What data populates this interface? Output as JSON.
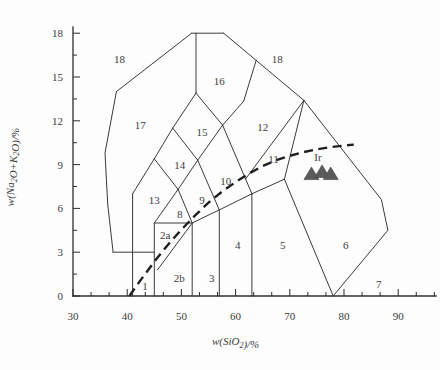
{
  "figure": {
    "type_note": "TAS classification diagram",
    "x_axis_title_parts": [
      [
        "t",
        "w(SiO"
      ],
      [
        "s",
        "2"
      ],
      [
        "t",
        ")/%"
      ]
    ],
    "y_axis_title_parts": [
      [
        "t",
        "w(Na"
      ],
      [
        "s",
        "2"
      ],
      [
        "t",
        "O+K"
      ],
      [
        "s",
        "2"
      ],
      [
        "t",
        "O)/%"
      ]
    ]
  },
  "chart_data": {
    "type": "scatter",
    "title": "",
    "xlabel": "w(SiO2)/%",
    "ylabel": "w(Na2O+K2O)/%",
    "xlim": [
      30,
      97
    ],
    "ylim": [
      0,
      18.5
    ],
    "grid": "off",
    "x_major_ticks": [
      30,
      40,
      50,
      60,
      70,
      80,
      90
    ],
    "y_major_ticks": [
      0,
      3,
      6,
      9,
      12,
      15,
      18
    ],
    "x_minor_step": 3.3333,
    "y_minor_step": 1.5,
    "field_boundaries": [
      {
        "name": "v41",
        "points": [
          [
            41,
            0
          ],
          [
            41,
            7
          ]
        ]
      },
      {
        "name": "v45",
        "points": [
          [
            45,
            0
          ],
          [
            45,
            5
          ]
        ]
      },
      {
        "name": "v52",
        "points": [
          [
            52,
            0
          ],
          [
            52,
            5
          ]
        ]
      },
      {
        "name": "v57",
        "points": [
          [
            57,
            0
          ],
          [
            57,
            5.9
          ]
        ]
      },
      {
        "name": "v63",
        "points": [
          [
            63,
            0
          ],
          [
            63,
            7
          ]
        ]
      },
      {
        "name": "h3",
        "points": [
          [
            37.4,
            3
          ],
          [
            45,
            3
          ]
        ]
      },
      {
        "name": "h5",
        "points": [
          [
            45,
            5
          ],
          [
            52,
            5
          ]
        ]
      },
      {
        "name": "divider-2a-2b",
        "points": [
          [
            45.6,
            1.8
          ],
          [
            52,
            5
          ]
        ]
      },
      {
        "name": "b-52-57",
        "points": [
          [
            52,
            5
          ],
          [
            57,
            5.9
          ]
        ]
      },
      {
        "name": "b-57-63",
        "points": [
          [
            57,
            5.9
          ],
          [
            63,
            7
          ]
        ]
      },
      {
        "name": "top-of-5",
        "points": [
          [
            63,
            7
          ],
          [
            69,
            8
          ]
        ]
      },
      {
        "name": "b-5-6",
        "points": [
          [
            69,
            8
          ],
          [
            78,
            0
          ]
        ]
      },
      {
        "name": "tri8-left",
        "points": [
          [
            45,
            5
          ],
          [
            49.4,
            7.3
          ]
        ]
      },
      {
        "name": "tri8-right",
        "points": [
          [
            49.4,
            7.3
          ],
          [
            52,
            5
          ]
        ]
      },
      {
        "name": "b-13-top",
        "points": [
          [
            41,
            7
          ],
          [
            45,
            9.4
          ]
        ]
      },
      {
        "name": "b-13-14",
        "points": [
          [
            45,
            9.4
          ],
          [
            49.4,
            7.3
          ]
        ]
      },
      {
        "name": "d14-ul",
        "points": [
          [
            45,
            9.4
          ],
          [
            48.4,
            11.5
          ]
        ]
      },
      {
        "name": "d14-ur",
        "points": [
          [
            48.4,
            11.5
          ],
          [
            53,
            9.3
          ]
        ]
      },
      {
        "name": "d14-lr",
        "points": [
          [
            53,
            9.3
          ],
          [
            49.4,
            7.3
          ]
        ]
      },
      {
        "name": "d15-ul",
        "points": [
          [
            48.4,
            11.5
          ],
          [
            52.7,
            13.9
          ]
        ]
      },
      {
        "name": "d15-ur",
        "points": [
          [
            52.7,
            13.9
          ],
          [
            57.6,
            11.7
          ]
        ]
      },
      {
        "name": "d15-lr",
        "points": [
          [
            57.6,
            11.7
          ],
          [
            53,
            9.3
          ]
        ]
      },
      {
        "name": "b-9-10",
        "points": [
          [
            53,
            9.3
          ],
          [
            57,
            5.9
          ]
        ]
      },
      {
        "name": "b-10-11",
        "points": [
          [
            57.6,
            11.7
          ],
          [
            63,
            7
          ]
        ]
      },
      {
        "name": "divider-11-12",
        "points": [
          [
            61.8,
            8.0
          ],
          [
            72.6,
            13.4
          ]
        ]
      },
      {
        "name": "b-11-6",
        "points": [
          [
            69,
            8
          ],
          [
            72.6,
            13.4
          ]
        ]
      },
      {
        "name": "roof-right",
        "points": [
          [
            57.8,
            18
          ],
          [
            72.6,
            13.4
          ]
        ]
      },
      {
        "name": "b-16-12",
        "points": [
          [
            57.6,
            11.7
          ],
          [
            61.5,
            13.35
          ],
          [
            63.8,
            16.15
          ]
        ]
      },
      {
        "name": "b-16-left",
        "points": [
          [
            52.7,
            13.9
          ],
          [
            52.7,
            18
          ]
        ]
      },
      {
        "name": "top-plateau",
        "points": [
          [
            51.9,
            18
          ],
          [
            57.8,
            18
          ]
        ]
      },
      {
        "name": "roof-left",
        "points": [
          [
            51.9,
            18
          ],
          [
            38,
            14
          ]
        ]
      },
      {
        "name": "left-edge-17",
        "points": [
          [
            38,
            14
          ],
          [
            35.9,
            9.8
          ],
          [
            36.4,
            6.3
          ],
          [
            37.4,
            3
          ]
        ]
      },
      {
        "name": "right-edge-6",
        "points": [
          [
            72.6,
            13.4
          ],
          [
            86.9,
            6.6
          ],
          [
            88.1,
            4.5
          ],
          [
            78,
            0
          ]
        ]
      }
    ],
    "field_labels": [
      {
        "text": "1",
        "x": 43.3,
        "y": 0.7
      },
      {
        "text": "2a",
        "x": 47.0,
        "y": 4.2,
        "size": 10
      },
      {
        "text": "2b",
        "x": 49.6,
        "y": 1.2,
        "size": 10
      },
      {
        "text": "3",
        "x": 55.6,
        "y": 1.2
      },
      {
        "text": "4",
        "x": 60.4,
        "y": 3.5
      },
      {
        "text": "5",
        "x": 68.7,
        "y": 3.5
      },
      {
        "text": "6",
        "x": 80.3,
        "y": 3.5
      },
      {
        "text": "7",
        "x": 86.4,
        "y": 0.8
      },
      {
        "text": "8",
        "x": 49.7,
        "y": 5.6
      },
      {
        "text": "9",
        "x": 53.8,
        "y": 6.6
      },
      {
        "text": "10",
        "x": 58.2,
        "y": 7.9
      },
      {
        "text": "11",
        "x": 67.0,
        "y": 9.4
      },
      {
        "text": "12",
        "x": 65.0,
        "y": 11.6
      },
      {
        "text": "13",
        "x": 45.0,
        "y": 6.6
      },
      {
        "text": "14",
        "x": 49.7,
        "y": 9.0
      },
      {
        "text": "15",
        "x": 53.8,
        "y": 11.2
      },
      {
        "text": "16",
        "x": 57.0,
        "y": 14.7
      },
      {
        "text": "17",
        "x": 42.4,
        "y": 11.7
      },
      {
        "text": "18",
        "x": 38.6,
        "y": 16.2
      },
      {
        "text": "18",
        "x": 67.7,
        "y": 16.2
      }
    ],
    "reference_line": {
      "label": "Ir",
      "label_x": 75.2,
      "label_y": 9.25,
      "style": "dashed",
      "points": [
        [
          40.4,
          0
        ],
        [
          42.5,
          1.1
        ],
        [
          45,
          2.35
        ],
        [
          47.5,
          3.5
        ],
        [
          50,
          4.55
        ],
        [
          52.5,
          5.5
        ],
        [
          55,
          6.4
        ],
        [
          57.5,
          7.15
        ],
        [
          60,
          7.8
        ],
        [
          62.5,
          8.4
        ],
        [
          65,
          8.9
        ],
        [
          67.5,
          9.3
        ],
        [
          70,
          9.6
        ],
        [
          72.5,
          9.85
        ],
        [
          75,
          10.05
        ],
        [
          77.5,
          10.2
        ],
        [
          80,
          10.3
        ],
        [
          81.8,
          10.37
        ]
      ]
    },
    "series": [
      {
        "name": "samples",
        "marker": "triangle",
        "color": "#5b5b5b",
        "points": [
          [
            74.0,
            8.35
          ],
          [
            75.95,
            8.5
          ],
          [
            77.55,
            8.35
          ]
        ]
      }
    ]
  }
}
